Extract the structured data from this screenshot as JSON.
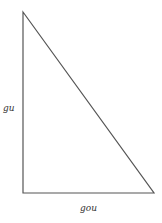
{
  "diagram": {
    "type": "right-triangle",
    "vertices": {
      "apex": [
        23,
        12
      ],
      "right_angle": [
        23,
        193
      ],
      "base_end": [
        154,
        193
      ]
    },
    "stroke_color": "#555555",
    "labels": {
      "vertical_side": "gu",
      "horizontal_side": "gou"
    }
  }
}
